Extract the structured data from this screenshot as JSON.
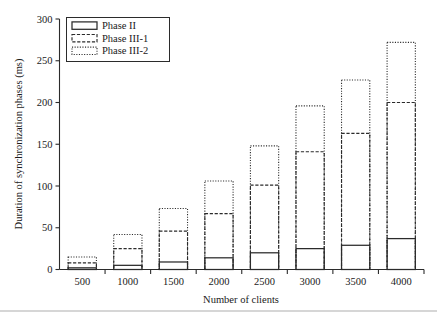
{
  "chart_data": {
    "type": "bar",
    "stacked_style": "cumulative-outline",
    "title": "",
    "xlabel": "Number of clients",
    "ylabel": "Duration of synchronization phases (ms)",
    "categories": [
      "500",
      "1000",
      "1500",
      "2000",
      "2500",
      "3000",
      "3500",
      "4000"
    ],
    "ylim": [
      0,
      300
    ],
    "yticks": [
      0,
      50,
      100,
      150,
      200,
      250,
      300
    ],
    "ytick_labels": [
      "0",
      "50",
      "100",
      "150",
      "200",
      "250",
      "300"
    ],
    "grid": false,
    "legend_position": "upper-left",
    "series": [
      {
        "name": "Phase II",
        "line_style": "solid",
        "cumulative_values": [
          2,
          5,
          9,
          14,
          20,
          25,
          29,
          37
        ]
      },
      {
        "name": "Phase III-1",
        "line_style": "dashed",
        "cumulative_values": [
          8,
          25,
          46,
          67,
          101,
          141,
          163,
          200
        ]
      },
      {
        "name": "Phase III-2",
        "line_style": "dotted",
        "cumulative_values": [
          15,
          42,
          73,
          106,
          148,
          196,
          227,
          272
        ]
      }
    ]
  },
  "legend": {
    "entries": [
      {
        "label": "Phase II"
      },
      {
        "label": "Phase III-1"
      },
      {
        "label": "Phase III-2"
      }
    ]
  },
  "axes": {
    "y_title": "Duration of synchronization phases (ms)",
    "x_title": "Number of clients"
  }
}
